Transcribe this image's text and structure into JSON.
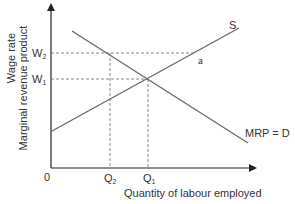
{
  "diagram": {
    "y_axis_label_line1": "Wage rate",
    "y_axis_label_line2": "Marginal revenue product",
    "x_axis_label": "Quantity of labour employed",
    "origin_label": "0",
    "wage_levels": {
      "w2": {
        "main": "W",
        "sub": "2"
      },
      "w1": {
        "main": "W",
        "sub": "1"
      }
    },
    "quantity_levels": {
      "q2": {
        "main": "Q",
        "sub": "2"
      },
      "q1": {
        "main": "Q",
        "sub": "1"
      }
    },
    "curves": {
      "supply_label": "S",
      "demand_label": "MRP = D"
    },
    "point_label": "a",
    "colors": {
      "axis": "#222222",
      "curve": "#6b6b6b",
      "dashed": "#777777",
      "text": "#333333"
    }
  }
}
